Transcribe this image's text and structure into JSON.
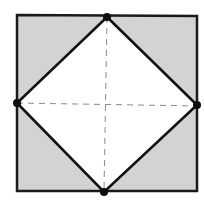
{
  "diagram": {
    "type": "geometry",
    "outer_square": {
      "points": [
        [
          17,
          15
        ],
        [
          197,
          16
        ],
        [
          197,
          191
        ],
        [
          17,
          191
        ]
      ],
      "fill": "#d3d3d3",
      "stroke": "#1a1a1a",
      "stroke_width": 2.5
    },
    "inner_rhombus": {
      "vertices": {
        "top": [
          107,
          17
        ],
        "right": [
          197,
          105
        ],
        "bottom": [
          104,
          192
        ],
        "left": [
          17,
          103
        ]
      },
      "fill": "#ffffff",
      "stroke": "#111111",
      "stroke_width": 2.6
    },
    "dashed_lines": {
      "horizontal": {
        "from": [
          17,
          103
        ],
        "to": [
          197,
          106
        ]
      },
      "vertical": {
        "from": [
          107,
          17
        ],
        "to": [
          104,
          192
        ]
      },
      "stroke": "#8a8a8a",
      "dash": "6,5"
    },
    "vertex_dot": {
      "radius": 4,
      "color": "#0d0d0d"
    }
  }
}
